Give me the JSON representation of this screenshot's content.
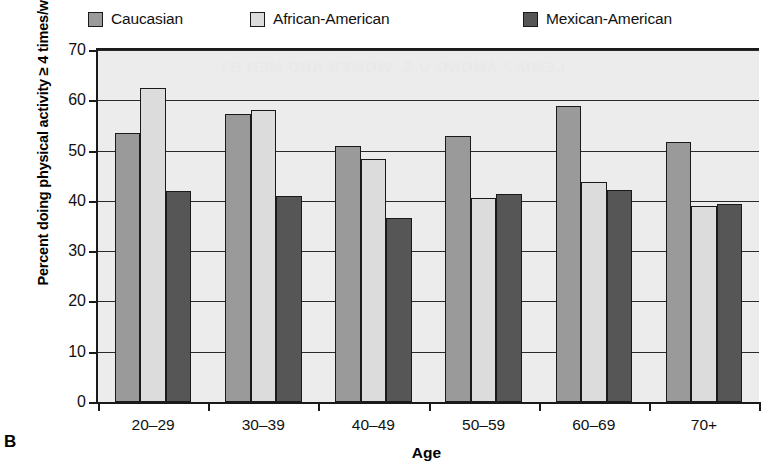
{
  "panel": {
    "label": "B"
  },
  "legend": {
    "position": "top",
    "items": [
      {
        "label": "Caucasian",
        "color": "#9a9a9a",
        "icon": "legend-swatch-icon"
      },
      {
        "label": "African-American",
        "color": "#dcdcdc",
        "icon": "legend-swatch-icon"
      },
      {
        "label": "Mexican-American",
        "color": "#565656",
        "icon": "legend-swatch-icon"
      }
    ]
  },
  "axes": {
    "ylabel": "Percent doing physical activity ≥ 4 times/week",
    "xlabel": "Age",
    "yticks": [
      0,
      10,
      20,
      30,
      40,
      50,
      60,
      70
    ]
  },
  "chart_data": {
    "type": "bar",
    "title": "",
    "subtitle": "",
    "xlabel": "Age",
    "ylabel": "Percent doing physical activity ≥ 4 times/week",
    "categories": [
      "20–29",
      "30–39",
      "40–49",
      "50–59",
      "60–69",
      "70+"
    ],
    "series": [
      {
        "name": "Caucasian",
        "color": "#9a9a9a",
        "values": [
          53.4,
          57.3,
          51.0,
          53.0,
          58.8,
          51.8
        ]
      },
      {
        "name": "African-American",
        "color": "#dcdcdc",
        "values": [
          62.4,
          58.0,
          48.3,
          40.5,
          43.7,
          39.0
        ]
      },
      {
        "name": "Mexican-American",
        "color": "#565656",
        "values": [
          42.0,
          40.9,
          36.5,
          41.4,
          42.2,
          39.3
        ]
      }
    ],
    "ylim": [
      0,
      70
    ],
    "ytick_step": 10,
    "grid": "horizontal",
    "legend_position": "top"
  },
  "bleed_text": [
    "LEMIA,² AMONG U.S. WOMEN AND MEN BY",
    "Age"
  ]
}
